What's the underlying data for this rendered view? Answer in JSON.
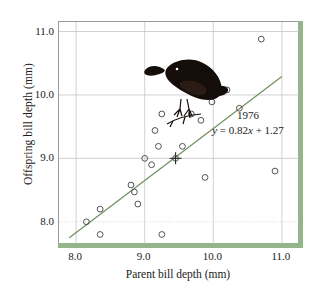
{
  "chart_data": {
    "type": "scatter",
    "title": "",
    "xlabel": "Parent bill depth (mm)",
    "ylabel": "Offspring bill depth (mm)",
    "xlim": [
      7.75,
      11.25
    ],
    "ylim": [
      7.65,
      11.15
    ],
    "xticks": [
      "8.0",
      "9.0",
      "10.0",
      "11.0"
    ],
    "xtick_values": [
      8.0,
      9.0,
      10.0,
      11.0
    ],
    "yticks": [
      "8.0",
      "9.0",
      "10.0",
      "11.0"
    ],
    "ytick_values": [
      8.0,
      9.0,
      10.0,
      11.0
    ],
    "grid": true,
    "legend": false,
    "annotations": {
      "year": "1976",
      "equation": "y = 0.82x + 1.27",
      "equation_lhs": "y",
      "equation_slope": "0.82",
      "equation_var": "x",
      "equation_intercept": "1.27"
    },
    "series": [
      {
        "name": "Offspring vs parent bill depth",
        "marker": "open-circle",
        "points": [
          [
            8.15,
            8.0
          ],
          [
            8.35,
            8.2
          ],
          [
            8.35,
            7.8
          ],
          [
            8.8,
            8.58
          ],
          [
            8.85,
            8.47
          ],
          [
            8.9,
            8.28
          ],
          [
            9.0,
            9.0
          ],
          [
            9.1,
            8.9
          ],
          [
            9.2,
            9.19
          ],
          [
            9.15,
            9.44
          ],
          [
            9.25,
            9.7
          ],
          [
            9.25,
            7.8
          ],
          [
            9.45,
            9.0
          ],
          [
            9.55,
            9.19
          ],
          [
            9.68,
            9.7
          ],
          [
            9.82,
            9.6
          ],
          [
            9.88,
            8.7
          ],
          [
            9.98,
            9.89
          ],
          [
            10.2,
            10.08
          ],
          [
            10.38,
            9.79
          ],
          [
            10.7,
            10.88
          ],
          [
            10.9,
            8.8
          ]
        ]
      }
    ],
    "fit_line": {
      "name": "regression-line",
      "slope": 0.82,
      "intercept": 1.27,
      "color": "#6f8f5f",
      "x_start": 7.9,
      "x_end": 11.0,
      "y_start": 7.75,
      "y_end": 10.29
    },
    "mean_marker": {
      "name": "mean-cross",
      "x": 9.45,
      "y": 9.0
    }
  },
  "illustration": {
    "name": "darwin-finch-bird",
    "alt": "dark finch perched on a twig"
  },
  "colors": {
    "panel_accent": "#94b489",
    "regression": "#6f8f5f",
    "marker_stroke": "#4a4a4a",
    "grid": "#c9c9c9",
    "text": "#1a1a1a"
  }
}
